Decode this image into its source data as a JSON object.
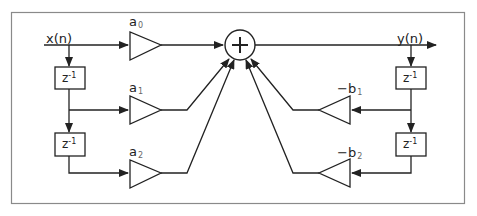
{
  "diagram": {
    "input_label": "x(n)",
    "output_label": "y(n)",
    "sum_node": "+",
    "delay_label": {
      "base": "z",
      "exp": "-1"
    },
    "feedforward_gains": [
      {
        "name": "a",
        "sub": "0"
      },
      {
        "name": "a",
        "sub": "1"
      },
      {
        "name": "a",
        "sub": "2"
      }
    ],
    "feedback_gains": [
      {
        "name": "−b",
        "sub": "1"
      },
      {
        "name": "−b",
        "sub": "2"
      }
    ]
  },
  "colors": {
    "line": "#222222",
    "frame": "#8a8a8a",
    "background": "#ffffff"
  }
}
